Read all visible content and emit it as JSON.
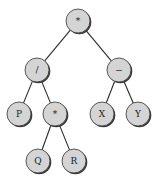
{
  "diagram": {
    "type": "expression-tree",
    "node_color": "#d4d4d4",
    "edge_color": "#2a2a2a",
    "radius": 12,
    "nodes": [
      {
        "id": "root",
        "label": "*",
        "x": 78,
        "y": 21
      },
      {
        "id": "div",
        "label": "/",
        "x": 37,
        "y": 70
      },
      {
        "id": "minus",
        "label": "−",
        "x": 119,
        "y": 70
      },
      {
        "id": "p",
        "label": "P",
        "x": 19,
        "y": 114
      },
      {
        "id": "mul",
        "label": "*",
        "x": 55,
        "y": 114
      },
      {
        "id": "x",
        "label": "X",
        "x": 102,
        "y": 114
      },
      {
        "id": "y",
        "label": "Y",
        "x": 138,
        "y": 114
      },
      {
        "id": "q",
        "label": "Q",
        "x": 38,
        "y": 161
      },
      {
        "id": "r",
        "label": "R",
        "x": 74,
        "y": 161
      }
    ],
    "edges": [
      {
        "from": "root",
        "to": "div"
      },
      {
        "from": "root",
        "to": "minus"
      },
      {
        "from": "div",
        "to": "p"
      },
      {
        "from": "div",
        "to": "mul"
      },
      {
        "from": "minus",
        "to": "x"
      },
      {
        "from": "minus",
        "to": "y"
      },
      {
        "from": "mul",
        "to": "q"
      },
      {
        "from": "mul",
        "to": "r"
      }
    ]
  }
}
